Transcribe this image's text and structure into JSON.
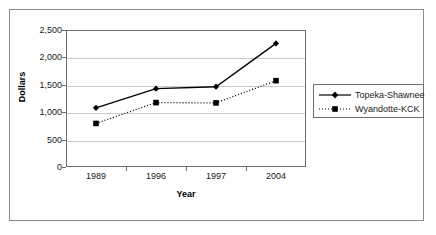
{
  "chart_data": {
    "type": "line",
    "title": "",
    "xlabel": "Year",
    "ylabel": "Dollars",
    "categories": [
      "1989",
      "1996",
      "1997",
      "2004"
    ],
    "series": [
      {
        "name": "Topeka-Shawnee",
        "marker": "diamond",
        "linestyle": "solid",
        "color": "#000000",
        "values": [
          1080,
          1430,
          1465,
          2255
        ]
      },
      {
        "name": "Wyandotte-KCK",
        "marker": "square",
        "linestyle": "dotted",
        "color": "#000000",
        "values": [
          795,
          1175,
          1170,
          1575
        ]
      }
    ],
    "ylim": [
      0,
      2500
    ],
    "yticks": [
      0,
      500,
      1000,
      1500,
      2000,
      2500
    ],
    "ytick_labels": [
      "0",
      "500",
      "1,000",
      "1,500",
      "2,000",
      "2,500"
    ],
    "grid": "horizontal",
    "legend_position": "right"
  },
  "legend": {
    "entries": [
      {
        "label": "Topeka-Shawnee"
      },
      {
        "label": "Wyandotte-KCK"
      }
    ]
  }
}
